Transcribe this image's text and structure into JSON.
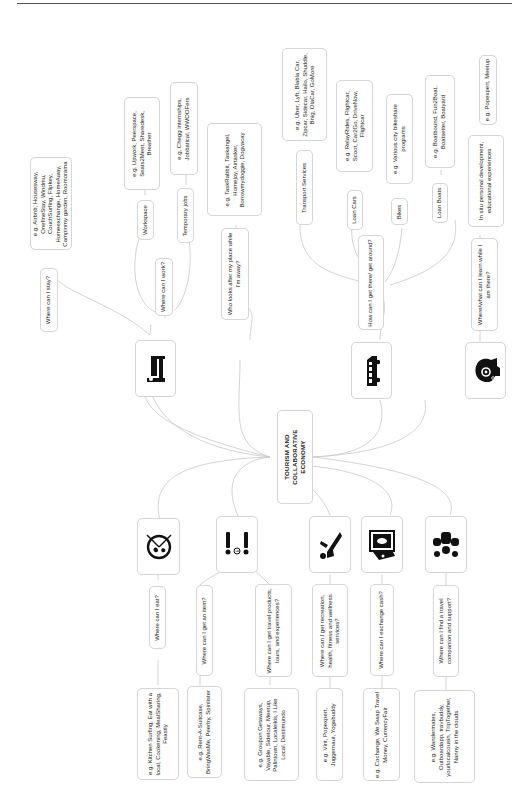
{
  "root": {
    "label": "TOURISM AND COLLABORATIVE ECONOMY"
  },
  "branches": [
    {
      "id": "stay",
      "icon": "bed-icon",
      "question": "Where can I stay?",
      "examples": "e.g. Airbnb, Housesway, OnefineStay, Windmu, CouchSurfing, Flipkey, Homeexchange, HomeAway, Campinmy garden, Roomorama"
    },
    {
      "id": "work",
      "question": "Where can I work?",
      "sub": [
        {
          "label": "Workspace",
          "examples": "e.g. Upwork, Peerspace, Seats2Meet, Sharedesk, Breather"
        },
        {
          "label": "Temporary jobs",
          "examples": "e.g. Chegg internships, Jobbatical, WWOOFers"
        }
      ]
    },
    {
      "id": "home-care",
      "question": "Who looks after my place while I'm away?",
      "examples": "e.g. TaskRabbit, Taskangel, Homejoy, Airtasker, Borrowmydoggie, Dogvacay"
    },
    {
      "id": "transport",
      "icon": "van-icon",
      "question": "How can I get there/ get around?",
      "sub": [
        {
          "label": "Transport Services",
          "examples": "e.g. Uber, Lyft, Blabla Car, Zipcar, Sidecar, Hailo, Shuddle, Bnig, OlaCar, GoMore"
        },
        {
          "label": "Loan Cars",
          "examples": "e.g. RelayRides, Flightcar, Scoot, Car2Go, DriveNow, Flightcar"
        },
        {
          "label": "Bikes",
          "examples": "e.g. Various city bikeshare programs"
        },
        {
          "label": "Loan Boats",
          "examples": "e.g. Boatbound, Fun2Boat, Boatsetter, Boatyard"
        }
      ]
    },
    {
      "id": "learn",
      "icon": "head-gear-icon",
      "question": "Where/what can I learn while I am there?",
      "sub": [
        {
          "label": "In situ personal development, educational experiences",
          "examples": "e.g. Popexpert, Meetup"
        }
      ]
    },
    {
      "id": "eat",
      "icon": "plate-cutlery-icon",
      "question": "Where can I eat?",
      "examples": "e.g. Kitchen Surfing, Eat with a local, Cookening, MealSharing, Feastly"
    },
    {
      "id": "item",
      "icon": "people-exchange-icon",
      "question": "Where can I get an item?",
      "examples": "e.g. Rent-A-Suitcase, BringWasMe, Peerby, Spinlister"
    },
    {
      "id": "products",
      "question": "Where can I get travel products, tours, and experiences?",
      "examples": "e.g. Groupon Getaways, Vayable, Sidetour, Meetup, Palintown, Localeikis, I Like Local, Destimundo"
    },
    {
      "id": "recreation",
      "icon": "slide-person-icon",
      "question": "Where can I get recreation, health, fitness and wellness services?",
      "examples": "e.g. Vint, Popexpert, Juggernaut, Yogabuddy"
    },
    {
      "id": "cash",
      "icon": "money-icon",
      "question": "Where can I exchange cash?",
      "examples": "e.g. Cochange, We Swap Travel Money, CurrencyFair"
    },
    {
      "id": "companion",
      "icon": "group-icon",
      "question": "Where can I find a travel companion and support?",
      "examples": "e.g. Wandermates, Outboardapp, travbuddy, yourlocalcousin, TripTogether, Nanny in the clouds"
    }
  ]
}
